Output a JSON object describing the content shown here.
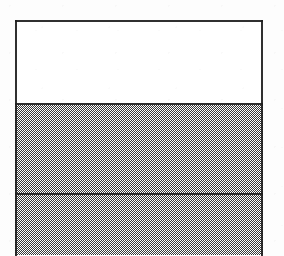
{
  "figure": {
    "type": "stratigraphic-column-diagram",
    "canvas": {
      "width": 284,
      "height": 255,
      "background_color": "#fdfdfd"
    },
    "box": {
      "left": 15,
      "top": 21,
      "right": 263,
      "width": 248,
      "stroke_color": "#1e1e1e",
      "stroke_width": 2,
      "bottom_open": true
    },
    "bands": [
      {
        "id": "band-1",
        "order": 1,
        "fill": "white",
        "fill_color": "#ffffff",
        "top": 21,
        "bottom": 104,
        "height": 83,
        "label": ""
      },
      {
        "id": "band-2",
        "order": 2,
        "fill": "dither-grey",
        "fill_color": "#7d7d7d",
        "top": 104,
        "bottom": 194,
        "height": 90,
        "label": ""
      },
      {
        "id": "band-3",
        "order": 3,
        "fill": "dither-grey",
        "fill_color": "#7d7d7d",
        "top": 194,
        "bottom": 255,
        "height": 61,
        "label": "",
        "clipped_at_image_edge": true
      }
    ],
    "dividers": [
      {
        "id": "divider-1",
        "y": 104,
        "stroke_color": "#1e1e1e",
        "stroke_width": 2
      },
      {
        "id": "divider-2",
        "y": 194,
        "stroke_color": "#1e1e1e",
        "stroke_width": 2
      }
    ],
    "labels": [],
    "annotations": []
  }
}
